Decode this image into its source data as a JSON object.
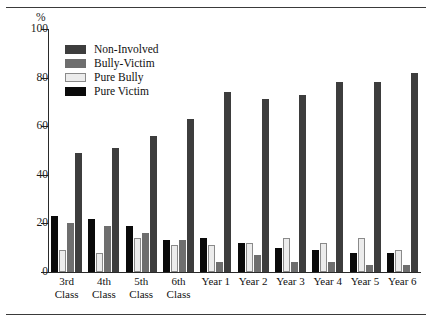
{
  "chart_data": {
    "type": "bar",
    "title": "",
    "subtitle": "",
    "xlabel": "",
    "ylabel": "%",
    "ylim": [
      0,
      100
    ],
    "yticks": [
      0,
      20,
      40,
      60,
      80,
      100
    ],
    "grid": false,
    "legend_position": "top-left",
    "categories": [
      "3rd Class",
      "4th Class",
      "5th Class",
      "6th Class",
      "Year 1",
      "Year 2",
      "Year 3",
      "Year 4",
      "Year 5",
      "Year 6"
    ],
    "category_lines": [
      [
        "3rd",
        "Class"
      ],
      [
        "4th",
        "Class"
      ],
      [
        "5th",
        "Class"
      ],
      [
        "6th",
        "Class"
      ],
      [
        "Year 1",
        ""
      ],
      [
        "Year 2",
        ""
      ],
      [
        "Year 3",
        ""
      ],
      [
        "Year 4",
        ""
      ],
      [
        "Year 5",
        ""
      ],
      [
        "Year 6",
        ""
      ]
    ],
    "series_order_in_group": [
      "Pure Victim",
      "Pure Bully",
      "Bully-Victim",
      "Non-Involved"
    ],
    "series": [
      {
        "name": "Pure Victim",
        "color": "#0a0a0a",
        "values": [
          23,
          22,
          19,
          13,
          14,
          12,
          10,
          9,
          8,
          8
        ]
      },
      {
        "name": "Pure Bully",
        "color": "#ececec",
        "values": [
          9,
          8,
          14,
          11,
          11,
          12,
          14,
          12,
          14,
          9
        ]
      },
      {
        "name": "Bully-Victim",
        "color": "#6e6e6e",
        "values": [
          20,
          19,
          16,
          13,
          4,
          7,
          4,
          4,
          3,
          3
        ]
      },
      {
        "name": "Non-Involved",
        "color": "#3d3d3d",
        "values": [
          49,
          51,
          56,
          63,
          74,
          71,
          73,
          78,
          78,
          82
        ]
      }
    ]
  },
  "legend": {
    "items": [
      {
        "label": "Non-Involved",
        "color": "#3d3d3d"
      },
      {
        "label": "Bully-Victim",
        "color": "#6e6e6e"
      },
      {
        "label": "Pure Bully",
        "color": "#ececec"
      },
      {
        "label": "Pure Victim",
        "color": "#0a0a0a"
      }
    ]
  },
  "axis": {
    "y_unit_label": "%",
    "y_tick_labels": [
      "100",
      "80",
      "60",
      "40",
      "20",
      "0"
    ]
  }
}
